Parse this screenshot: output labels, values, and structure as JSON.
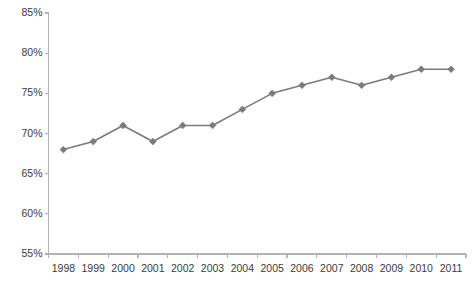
{
  "chart_data": {
    "type": "line",
    "title": "",
    "subtitle": "",
    "xlabel": "",
    "ylabel": "",
    "categories": [
      "1998",
      "1999",
      "2000",
      "2001",
      "2002",
      "2003",
      "2004",
      "2005",
      "2006",
      "2007",
      "2008",
      "2009",
      "2010",
      "2011"
    ],
    "values": [
      68,
      69,
      71,
      69,
      71,
      71,
      73,
      75,
      76,
      77,
      76,
      77,
      78,
      78
    ],
    "value_suffix": "%",
    "ylim": [
      55,
      85
    ],
    "ytick_step": 5,
    "ytick_labels": [
      "85%",
      "80%",
      "75%",
      "70%",
      "65%",
      "60%",
      "55%"
    ],
    "ytick_values": [
      85,
      80,
      75,
      70,
      65,
      60,
      55
    ],
    "grid": false,
    "legend": null,
    "legend_position": "none",
    "marker": "diamond",
    "series_color": "#7b7b7b",
    "axis_color": "#b3b3b3",
    "text_color": "#3b3b3b"
  }
}
